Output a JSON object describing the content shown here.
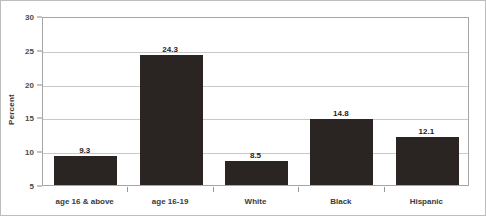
{
  "chart_data": {
    "type": "bar",
    "title": "",
    "xlabel": "",
    "ylabel": "Percent",
    "categories": [
      "age 16 & above",
      "age 16-19",
      "White",
      "Black",
      "Hispanic"
    ],
    "values": [
      9.3,
      24.3,
      8.5,
      14.8,
      12.1
    ],
    "value_labels": [
      "9.3",
      "24.3",
      "8.5",
      "14.8",
      "12.1"
    ],
    "ylim": [
      5,
      30
    ],
    "ytick_labels": [
      "30",
      "25",
      "20",
      "15",
      "10",
      "5"
    ],
    "ytick_values": [
      30,
      25,
      20,
      15,
      10,
      5
    ],
    "grid": true,
    "legend": "none",
    "bar_color": "#2a2522",
    "gridline_color": "#c8c8c8",
    "axis_color": "#a6a6a6",
    "background_color": "#ffffff",
    "text_color": "#3a3a3a"
  }
}
